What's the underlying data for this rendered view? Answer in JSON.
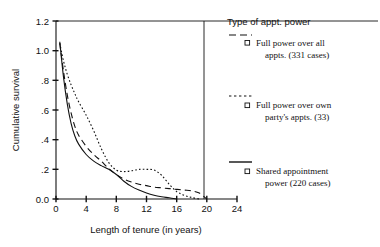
{
  "chart_data": {
    "type": "line",
    "title": "",
    "xlabel": "Length of tenure (in years)",
    "ylabel": "Cumulative survival",
    "xlim": [
      0,
      24
    ],
    "ylim": [
      0.0,
      1.2
    ],
    "xticks": [
      "0",
      "4",
      "8",
      "12",
      "16",
      "20",
      "24"
    ],
    "xtick_values": [
      0,
      4,
      8,
      12,
      16,
      20,
      24
    ],
    "yticks": [
      "0.0",
      ".2",
      ".4",
      ".6",
      ".8",
      "1.0",
      "1.2"
    ],
    "ytick_values": [
      0.0,
      0.2,
      0.4,
      0.6,
      0.8,
      1.0,
      1.2
    ],
    "grid": false,
    "legend_position": "right",
    "legend_title": "Type of appt. power",
    "series": [
      {
        "name": "Full power over all appts. (331 cases)",
        "cases": 331,
        "style": "dashed",
        "marker": "square",
        "points": [
          [
            0.5,
            1.05
          ],
          [
            1.0,
            0.86
          ],
          [
            1.5,
            0.7
          ],
          [
            2.0,
            0.58
          ],
          [
            2.5,
            0.49
          ],
          [
            3.0,
            0.43
          ],
          [
            4.0,
            0.355
          ],
          [
            5.0,
            0.3
          ],
          [
            6.0,
            0.255
          ],
          [
            7.0,
            0.205
          ],
          [
            8.0,
            0.165
          ],
          [
            9.0,
            0.135
          ],
          [
            10.0,
            0.115
          ],
          [
            11.0,
            0.1
          ],
          [
            12.0,
            0.09
          ],
          [
            13.0,
            0.08
          ],
          [
            14.0,
            0.075
          ],
          [
            15.0,
            0.07
          ],
          [
            16.0,
            0.065
          ],
          [
            17.0,
            0.06
          ],
          [
            18.0,
            0.055
          ],
          [
            19.0,
            0.04
          ],
          [
            20.0,
            0.0
          ]
        ]
      },
      {
        "name": "Full power over own party's appts. (33)",
        "cases": 33,
        "style": "dotted",
        "marker": "square",
        "points": [
          [
            0.5,
            1.05
          ],
          [
            1.0,
            0.93
          ],
          [
            1.5,
            0.84
          ],
          [
            2.0,
            0.77
          ],
          [
            2.5,
            0.71
          ],
          [
            3.0,
            0.655
          ],
          [
            4.0,
            0.565
          ],
          [
            5.0,
            0.46
          ],
          [
            6.0,
            0.34
          ],
          [
            7.0,
            0.245
          ],
          [
            8.0,
            0.195
          ],
          [
            9.0,
            0.185
          ],
          [
            10.0,
            0.19
          ],
          [
            11.0,
            0.2
          ],
          [
            12.0,
            0.2
          ],
          [
            13.0,
            0.195
          ],
          [
            14.0,
            0.16
          ],
          [
            15.0,
            0.1
          ],
          [
            16.0,
            0.05
          ],
          [
            17.0,
            0.025
          ],
          [
            18.0,
            0.01
          ],
          [
            19.0,
            0.0
          ]
        ]
      },
      {
        "name": "Shared appointment power (220 cases)",
        "cases": 220,
        "style": "solid",
        "marker": "square",
        "points": [
          [
            0.5,
            1.06
          ],
          [
            1.0,
            0.82
          ],
          [
            1.5,
            0.64
          ],
          [
            2.0,
            0.51
          ],
          [
            2.5,
            0.425
          ],
          [
            3.0,
            0.37
          ],
          [
            4.0,
            0.3
          ],
          [
            5.0,
            0.255
          ],
          [
            6.0,
            0.225
          ],
          [
            7.0,
            0.2
          ],
          [
            8.0,
            0.165
          ],
          [
            9.0,
            0.12
          ],
          [
            10.0,
            0.085
          ],
          [
            11.0,
            0.06
          ],
          [
            12.0,
            0.04
          ],
          [
            13.0,
            0.025
          ],
          [
            14.0,
            0.015
          ],
          [
            15.0,
            0.008
          ],
          [
            16.0,
            0.0
          ]
        ]
      }
    ]
  },
  "axes": {
    "ylabel": "Cumulative survival",
    "xlabel": "Length of tenure (in years)"
  },
  "legend": {
    "title": "Type of appt. power",
    "entries": [
      {
        "line1": "Full power over all",
        "line2": "appts. (331 cases)",
        "style": "dashed"
      },
      {
        "line1": "Full power over own",
        "line2": "party's appts. (33)",
        "style": "dotted"
      },
      {
        "line1": "Shared appointment",
        "line2": "power (220 cases)",
        "style": "solid"
      }
    ]
  }
}
